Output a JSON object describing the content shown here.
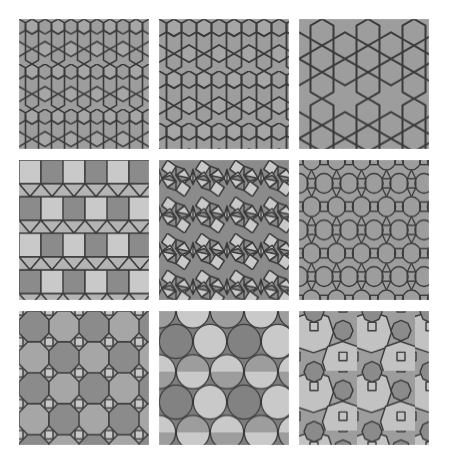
{
  "gallery": {
    "title": "Tiling pattern swatch grid",
    "background_color": "#ffffff",
    "columns": 3,
    "rows": 3,
    "cell_width_px": 130,
    "cell_height_px": 134,
    "gap_px": 10
  },
  "palette": {
    "light": "#c9c9c9",
    "light_alt": "#c2c2c2",
    "medium": "#9d9d9d",
    "medium_alt": "#a6a6a6",
    "dark": "#828282",
    "dark_alt": "#8b8b8b",
    "line": "#3a3a3a",
    "line_soft": "#555555",
    "background": "#ffffff"
  },
  "tiles": [
    {
      "index": 0,
      "row": 1,
      "column": 1,
      "name": "star-hexagon-triangle-tiling",
      "label": "3.6.3.6 star-and-triangle tiling (fine)",
      "pattern_type": "hexagon-triangle",
      "cell_size_px": 26,
      "line_width_px": 1.6,
      "fill": "#9d9d9d",
      "accent_fill": "#a6a6a6",
      "stroke": "#3a3a3a"
    },
    {
      "index": 1,
      "row": 1,
      "column": 2,
      "name": "star-hexagon-triangle-tiling-medium",
      "label": "3.6.3.6 star-and-triangle tiling (medium)",
      "pattern_type": "hexagon-triangle",
      "cell_size_px": 30,
      "line_width_px": 1.8,
      "fill": "#9d9d9d",
      "accent_fill": "#a6a6a6",
      "stroke": "#3a3a3a"
    },
    {
      "index": 2,
      "row": 1,
      "column": 3,
      "name": "trihexagonal-tiling-coarse",
      "label": "Trihexagonal tiling 3.6.3.6 (coarse)",
      "pattern_type": "hexagon-triangle",
      "cell_size_px": 46,
      "line_width_px": 2.0,
      "fill": "#9d9d9d",
      "accent_fill": "#9d9d9d",
      "stroke": "#3a3a3a"
    },
    {
      "index": 3,
      "row": 2,
      "column": 1,
      "name": "elongated-triangular-tiling",
      "label": "Elongated triangular tiling 3.3.3.4.4",
      "pattern_type": "square-triangle-rows",
      "cell_size_px": 22,
      "line_width_px": 1.4,
      "fill": "#c9c9c9",
      "accent_fill": "#8b8b8b",
      "stroke": "#3a3a3a"
    },
    {
      "index": 4,
      "row": 2,
      "column": 2,
      "name": "snub-square-tiling",
      "label": "Snub square tiling 3.3.4.3.4",
      "pattern_type": "snub-square",
      "cell_size_px": 34,
      "line_width_px": 1.4,
      "fill": "#c9c9c9",
      "accent_fill": "#8b8b8b",
      "stroke": "#3a3a3a"
    },
    {
      "index": 5,
      "row": 2,
      "column": 3,
      "name": "rhombitrihexagonal-circle-tiling",
      "label": "Rhombitrihexagonal tiling 3.4.6.4 with inscribed circles",
      "pattern_type": "hex-circle-lattice",
      "cell_size_px": 25,
      "line_width_px": 1.3,
      "fill": "#9d9d9d",
      "accent_fill": "#a6a6a6",
      "stroke": "#3a3a3a"
    },
    {
      "index": 6,
      "row": 3,
      "column": 1,
      "name": "truncated-square-octagon-tiling",
      "label": "Truncated square tiling 4.8.8",
      "pattern_type": "octagon-square",
      "cell_size_px": 30,
      "line_width_px": 1.4,
      "fill": "#8b8b8b",
      "accent_fill": "#a6a6a6",
      "square_fill": "#c9c9c9",
      "stroke": "#3a3a3a"
    },
    {
      "index": 7,
      "row": 3,
      "column": 2,
      "name": "hexagonal-circle-packing",
      "label": "Hexagonal circle packing, three-tone",
      "pattern_type": "circle-packing",
      "cell_size_px": 34,
      "line_width_px": 1.2,
      "fill": "#9d9d9d",
      "accent_fill": "#c9c9c9",
      "dark_fill": "#828282",
      "stroke": "#3a3a3a"
    },
    {
      "index": 8,
      "row": 3,
      "column": 3,
      "name": "two-size-octagon-circle-tiling",
      "label": "Two-size octagon and circle tiling",
      "pattern_type": "dual-octagon",
      "cell_size_px": 44,
      "line_width_px": 1.4,
      "fill": "#c2c2c2",
      "accent_fill": "#8b8b8b",
      "square_fill": "#9d9d9d",
      "stroke": "#3a3a3a"
    }
  ]
}
